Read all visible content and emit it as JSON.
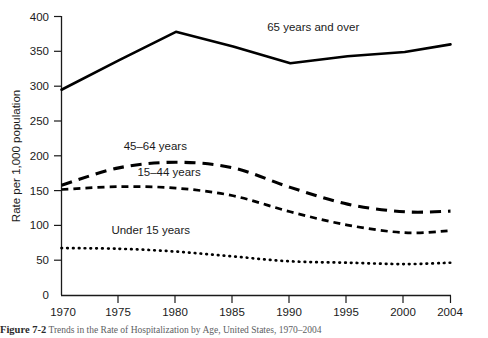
{
  "figure": {
    "caption_number": "Figure 7-2",
    "caption_text": "Trends in the Rate of Hospitalization by Age, United States, 1970–2004"
  },
  "chart_data": {
    "type": "line",
    "title": "",
    "xlabel": "",
    "ylabel": "Rate per 1,000 population",
    "xlim": [
      1970,
      2004
    ],
    "ylim": [
      0,
      400
    ],
    "grid": false,
    "legend_position": "inline-annotations",
    "y_ticks": [
      0,
      50,
      100,
      150,
      200,
      250,
      300,
      350,
      400
    ],
    "y_tick_labels": [
      "0",
      "50",
      "100",
      "150",
      "200",
      "250",
      "300",
      "350",
      "400"
    ],
    "x_ticks": [
      1970,
      1975,
      1980,
      1985,
      1990,
      1995,
      2000,
      2004
    ],
    "x_tick_labels": [
      "1970",
      "1975",
      "1980",
      "1985",
      "1990",
      "1995",
      "2000",
      "2004"
    ],
    "x": [
      1970,
      1975,
      1980,
      1985,
      1990,
      1995,
      2000,
      2004
    ],
    "series": [
      {
        "name": "65 years and over",
        "style": "solid",
        "values": [
          295,
          337,
          378,
          357,
          333,
          343,
          349,
          360
        ]
      },
      {
        "name": "45–64 years",
        "style": "long-dash",
        "values": [
          158,
          183,
          191,
          183,
          155,
          131,
          120,
          121
        ]
      },
      {
        "name": "15–44 years",
        "style": "short-dash",
        "values": [
          152,
          156,
          154,
          143,
          120,
          101,
          90,
          93
        ]
      },
      {
        "name": "Under 15 years",
        "style": "dotted",
        "values": [
          68,
          67,
          63,
          56,
          49,
          47,
          45,
          47
        ]
      }
    ],
    "annotations": [
      {
        "text": "65 years and over",
        "x": 1992,
        "y": 379
      },
      {
        "text": "45–64 years",
        "x": 1978.2,
        "y": 209
      },
      {
        "text": "15–44 years",
        "x": 1979.4,
        "y": 172
      },
      {
        "text": "Under 15 years",
        "x": 1977.8,
        "y": 88
      }
    ]
  }
}
